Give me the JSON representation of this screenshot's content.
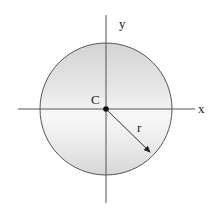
{
  "diagram": {
    "type": "circle-with-axes",
    "center_label": "C",
    "radius_label": "r",
    "x_axis_label": "x",
    "y_axis_label": "y",
    "colors": {
      "stroke": "#555555",
      "fill_dark": "#d6d6d6",
      "fill_light": "#f7f7f7",
      "text": "#222222"
    }
  }
}
